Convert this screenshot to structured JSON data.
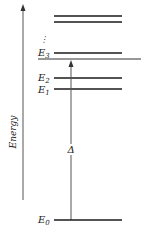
{
  "diagram": {
    "axis_label": "Energy",
    "levels": [
      {
        "label": "E",
        "sub": "0",
        "name": "ground-state"
      },
      {
        "label": "E",
        "sub": "1",
        "name": "level-1"
      },
      {
        "label": "E",
        "sub": "2",
        "name": "level-2"
      },
      {
        "label": "E",
        "sub": "3",
        "name": "level-3"
      }
    ],
    "gap_label": "Δ",
    "ellipsis": "⋮",
    "colors": {
      "line": "#1a1a1a",
      "axis": "#444444"
    }
  }
}
